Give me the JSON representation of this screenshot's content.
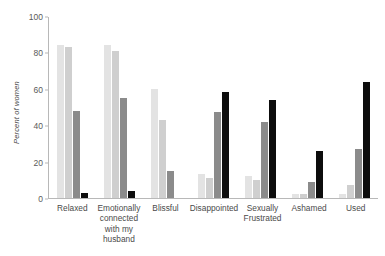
{
  "chart_data": {
    "type": "bar",
    "title": "",
    "subtitle": "",
    "xlabel": "",
    "ylabel": "Percent of women",
    "ylim": [
      0,
      100
    ],
    "yticks": [
      0,
      20,
      40,
      60,
      80,
      100
    ],
    "ytick_labels": [
      "0",
      "20",
      "40",
      "60",
      "80",
      "100"
    ],
    "grid": false,
    "legend": "none",
    "categories": [
      "Relaxed",
      "Emotionally connected with my husband",
      "Blissful",
      "Disappointed",
      "Sexually Frustrated",
      "Ashamed",
      "Used"
    ],
    "series": [
      {
        "name": "series-1",
        "color": "#e3e3e3",
        "values": [
          84,
          84,
          60,
          13,
          12,
          2,
          2
        ]
      },
      {
        "name": "series-2",
        "color": "#cfcfcf",
        "values": [
          83,
          81,
          43,
          11,
          10,
          2,
          7
        ]
      },
      {
        "name": "series-3",
        "color": "#8b8b8b",
        "values": [
          48,
          55,
          15,
          47,
          42,
          9,
          27
        ]
      },
      {
        "name": "series-4",
        "color": "#0d0d0d",
        "values": [
          3,
          4,
          0,
          58,
          54,
          26,
          64
        ]
      }
    ]
  },
  "axis": {
    "y_label_text": "Percent of women"
  }
}
